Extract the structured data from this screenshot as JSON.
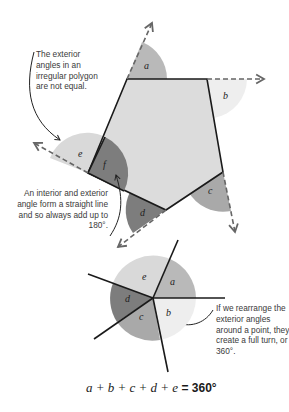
{
  "annotations": {
    "top_left": "The exterior angles in an irregular polygon are not equal.",
    "middle_left": "An interior and exterior angle form a straight line and so always add up to 180°.",
    "bottom_right": "If we rearrange the exterior angles around a point, they create a full turn, or 360°."
  },
  "angle_labels": {
    "a": "a",
    "b": "b",
    "c": "c",
    "d": "d",
    "e": "e",
    "f": "f"
  },
  "equation": {
    "vars": "a + b + c + d + e",
    "result": " = 360°"
  },
  "colors": {
    "polygon_fill": "#dcdcdc",
    "angle_a": "#b9b9b9",
    "angle_b": "#eeeeee",
    "angle_c": "#a9a9a9",
    "angle_d": "#7d7d7d",
    "angle_e": "#d9d9d9",
    "angle_f": "#7d7d7d",
    "line": "#1a1a1a",
    "dashed": "#666666"
  }
}
